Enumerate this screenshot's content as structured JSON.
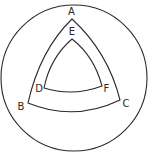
{
  "diagram": {
    "type": "nested curved triangles inside a circle",
    "outer_circle": {
      "cx": 74,
      "cy": 78,
      "r": 73
    },
    "outer_triangle": {
      "vertices": {
        "A": {
          "label": "A",
          "x": 72,
          "y": 19,
          "lx": 71.5,
          "ly": 15
        },
        "B": {
          "label": "B",
          "x": 28,
          "y": 103,
          "lx": 21,
          "ly": 110
        },
        "C": {
          "label": "C",
          "x": 120,
          "y": 100,
          "lx": 126,
          "ly": 107
        }
      }
    },
    "inner_triangle": {
      "vertices": {
        "E": {
          "label": "E",
          "x": 72,
          "y": 39,
          "lx": 72,
          "ly": 35
        },
        "D": {
          "label": "D",
          "x": 44,
          "y": 88,
          "lx": 39,
          "ly": 92
        },
        "F": {
          "label": "F",
          "x": 102,
          "y": 86,
          "lx": 106.5,
          "ly": 92
        }
      }
    },
    "colors": {
      "stroke": "#2a2a2a",
      "background": "#ffffff"
    }
  }
}
